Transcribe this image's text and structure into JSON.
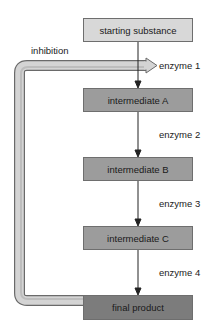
{
  "diagram": {
    "type": "metabolic-pathway-feedback-inhibition",
    "nodes": [
      {
        "id": "start",
        "label": "starting substance"
      },
      {
        "id": "a",
        "label": "intermediate A"
      },
      {
        "id": "b",
        "label": "intermediate B"
      },
      {
        "id": "c",
        "label": "intermediate C"
      },
      {
        "id": "final",
        "label": "final product"
      }
    ],
    "enzymes": [
      "enzyme 1",
      "enzyme 2",
      "enzyme 3",
      "enzyme 4"
    ],
    "feedback": {
      "label": "inhibition",
      "from": "final product",
      "to": "enzyme 1"
    },
    "colors": {
      "start_fill": "#d8d8d8",
      "intermediate_fill": "#9c9c9c",
      "final_fill": "#7c7c7c",
      "pipe_fill": "#d4d4d4",
      "stroke": "#555555"
    }
  }
}
